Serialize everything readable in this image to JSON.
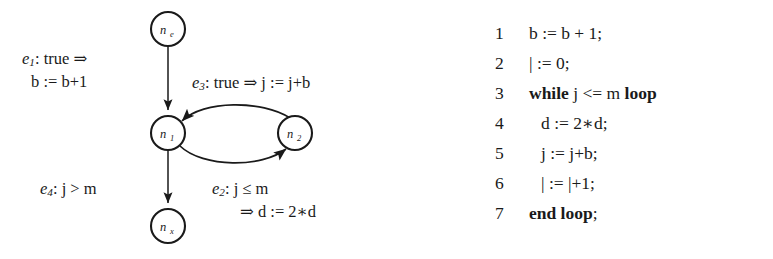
{
  "figure": {
    "kind": "control-flow-graph-with-code-listing"
  },
  "diagram": {
    "nodes": [
      {
        "id": "ne",
        "base": "n",
        "sub": "e",
        "label": "n_e",
        "cx": 168,
        "cy": 29,
        "r": 17
      },
      {
        "id": "n1",
        "base": "n",
        "sub": "1",
        "label": "n_1",
        "cx": 168,
        "cy": 133,
        "r": 17
      },
      {
        "id": "n2",
        "base": "n",
        "sub": "2",
        "label": "n_2",
        "cx": 295,
        "cy": 133,
        "r": 17
      },
      {
        "id": "nx",
        "base": "n",
        "sub": "x",
        "label": "n_x",
        "cx": 168,
        "cy": 226,
        "r": 17
      }
    ],
    "edges": [
      {
        "id": "e1",
        "from": "ne",
        "to": "n1",
        "name": "e",
        "sub": "1",
        "line1": ": true ⇒",
        "line2": "b := b+1",
        "shape": "straight-vertical"
      },
      {
        "id": "e3",
        "from": "n2",
        "to": "n1",
        "name": "e",
        "sub": "3",
        "line1": ": true ⇒ j := j+b",
        "line2": "",
        "shape": "arc-upper-right-to-left"
      },
      {
        "id": "e2",
        "from": "n1",
        "to": "n2",
        "name": "e",
        "sub": "2",
        "line1": ": j ≤ m",
        "line2": "⇒ d := 2∗d",
        "shape": "arc-lower-left-to-right"
      },
      {
        "id": "e4",
        "from": "n1",
        "to": "nx",
        "name": "e",
        "sub": "4",
        "line1": ": j > m",
        "line2": "",
        "shape": "straight-vertical"
      }
    ],
    "colors": {
      "stroke": "#1a1a1a",
      "fill": "#ffffff",
      "text": "#1a1a1a"
    }
  },
  "code": {
    "lines": [
      {
        "num": "1",
        "indent": 0,
        "parts": [
          {
            "t": "b := b + 1;",
            "bold": false
          }
        ]
      },
      {
        "num": "2",
        "indent": 0,
        "parts": [
          {
            "t": "| := 0;",
            "bold": false
          }
        ]
      },
      {
        "num": "3",
        "indent": 0,
        "parts": [
          {
            "t": "while",
            "bold": true
          },
          {
            "t": " j <= m ",
            "bold": false
          },
          {
            "t": "loop",
            "bold": true
          }
        ]
      },
      {
        "num": "4",
        "indent": 1,
        "parts": [
          {
            "t": "d := 2∗d;",
            "bold": false
          }
        ]
      },
      {
        "num": "5",
        "indent": 1,
        "parts": [
          {
            "t": "j := j+b;",
            "bold": false
          }
        ]
      },
      {
        "num": "6",
        "indent": 1,
        "parts": [
          {
            "t": "| := |+1;",
            "bold": false
          }
        ]
      },
      {
        "num": "7",
        "indent": 0,
        "parts": [
          {
            "t": "end loop",
            "bold": true
          },
          {
            "t": ";",
            "bold": false
          }
        ]
      }
    ]
  }
}
